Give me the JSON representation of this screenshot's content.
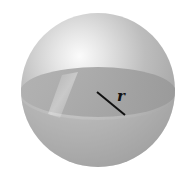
{
  "diagram": {
    "shape": "sphere",
    "radius_label": "r",
    "colors": {
      "background": "#ffffff",
      "sphere_light": "#f4f4f4",
      "sphere_mid": "#b8b8b8",
      "sphere_dark": "#8c8c8c",
      "cross_section": "#9a9a9a",
      "radius_line": "#111111"
    }
  }
}
